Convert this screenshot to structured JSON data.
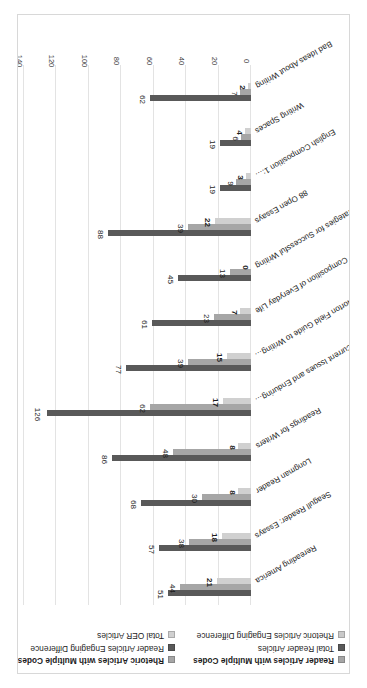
{
  "chart_data": {
    "type": "bar",
    "orientation": "horizontal",
    "title": "",
    "xlabel": "",
    "ylabel": "",
    "xlim": [
      0,
      140
    ],
    "xticks": [
      "0",
      "20",
      "40",
      "60",
      "80",
      "100",
      "120",
      "140"
    ],
    "grid": true,
    "legend_position": "top",
    "rotation_note": "chart rendered rotated 180 degrees on page",
    "categories": [
      "Rereading America",
      "Seagull Reader: Essays",
      "Longman Reader",
      "Readings for Writers",
      "Current Issues and Enduring…",
      "Norton Field Guide to Writing…",
      "Composition of Everyday Life",
      "Strategies for Successful Writing",
      "88 Open Essays",
      "English Composition 1:…",
      "Writing Spaces",
      "Bad Ideas About Writing"
    ],
    "groups": [
      {
        "name": "Reader",
        "categories": [
          "Rereading America",
          "Seagull Reader: Essays",
          "Longman Reader",
          "Readings for Writers"
        ],
        "series": [
          {
            "name": "Total Reader Articles",
            "values": [
              51,
              57,
              68,
              86
            ]
          },
          {
            "name": "Reader Articles with Multiple Codes",
            "values": [
              44,
              38,
              30,
              48
            ]
          },
          {
            "name": "Reader Articles Engaging Difference",
            "values": [
              21,
              18,
              8,
              8
            ]
          }
        ]
      },
      {
        "name": "Rhetoric",
        "categories": [
          "Current Issues and Enduring…",
          "Norton Field Guide to Writing…",
          "Composition of Everyday Life",
          "Strategies for Successful Writing",
          "88 Open Essays"
        ],
        "series": [
          {
            "name": "Total Rhetoric Articles",
            "values": [
              126,
              77,
              61,
              45,
              0
            ]
          },
          {
            "name": "Rhetoric Articles with Multiple Codes",
            "values": [
              62,
              39,
              23,
              13,
              0
            ]
          },
          {
            "name": "Rhetoric Articles Engaging Difference",
            "values": [
              17,
              15,
              7,
              0,
              0
            ]
          }
        ]
      },
      {
        "name": "OER",
        "categories": [
          "English Composition 1:…",
          "Writing Spaces",
          "Bad Ideas About Writing"
        ],
        "series": [
          {
            "name": "Total OER Articles",
            "values": [
              88,
              19,
              19,
              62
            ]
          },
          {
            "name": "OER Articles with Multiple Codes",
            "values": [
              39,
              9,
              6,
              7
            ]
          },
          {
            "name": "OER Articles Engaging Difference",
            "values": [
              22,
              3,
              4,
              2
            ]
          }
        ]
      }
    ],
    "bars": [
      {
        "category": "Rereading America",
        "total": 51,
        "multiple_codes": 44,
        "engaging_difference": 21
      },
      {
        "category": "Seagull Reader: Essays",
        "total": 57,
        "multiple_codes": 38,
        "engaging_difference": 18
      },
      {
        "category": "Longman Reader",
        "total": 68,
        "multiple_codes": 30,
        "engaging_difference": 8
      },
      {
        "category": "Readings for Writers",
        "total": 86,
        "multiple_codes": 48,
        "engaging_difference": 8
      },
      {
        "category": "Current Issues and Enduring…",
        "total": 126,
        "multiple_codes": 62,
        "engaging_difference": 17
      },
      {
        "category": "Norton Field Guide to Writing…",
        "total": 77,
        "multiple_codes": 39,
        "engaging_difference": 15
      },
      {
        "category": "Composition of Everyday Life",
        "total": 61,
        "multiple_codes": 23,
        "engaging_difference": 7
      },
      {
        "category": "Strategies for Successful Writing",
        "total": 45,
        "multiple_codes": 13,
        "engaging_difference": 0
      },
      {
        "category": "88 Open Essays",
        "total": 88,
        "multiple_codes": 39,
        "engaging_difference": 22
      },
      {
        "category": "English Composition 1:…",
        "total": 19,
        "multiple_codes": 9,
        "engaging_difference": 3
      },
      {
        "category": "Writing Spaces",
        "total": 19,
        "multiple_codes": 6,
        "engaging_difference": 4
      },
      {
        "category": "Bad Ideas About Writing",
        "total": 62,
        "multiple_codes": 7,
        "engaging_difference": 2
      }
    ],
    "colors": {
      "multiple_codes": "#a6a6a6",
      "total": "#595959",
      "engaging_difference": "#d0d0d0",
      "gridline": "#e3e3e3",
      "axis": "#9a9a9a",
      "text": "#1d1d1d",
      "background": "#ffffff"
    }
  },
  "legend": {
    "column_left": [
      {
        "label": "Reader Articles with Multiple Codes",
        "color": "#a6a6a6",
        "bold": true
      },
      {
        "label": "Total Reader Articles",
        "color": "#595959",
        "bold": false
      },
      {
        "label": "Rhetoric Articles Engaging Difference",
        "color": "#c9c9c9",
        "bold": false
      }
    ],
    "column_mid": [
      {
        "label": "Rhetoric Articles with Multiple Codes",
        "color": "#a6a6a6",
        "bold": true
      },
      {
        "label": "Reader Articles Engaging Difference",
        "color": "#595959",
        "bold": false
      },
      {
        "label": "Total OER Articles",
        "color": "#d0d0d0",
        "bold": false
      }
    ],
    "column_right": [
      {
        "label": "OER Articles with Multiple Codes",
        "color": "#a6a6a6",
        "bold": true
      },
      {
        "label": "Total Rhetoric Articles",
        "color": "#595959",
        "bold": false
      },
      {
        "label": "OER Articles Engaging Difference",
        "color": "#d0d0d0",
        "bold": false
      }
    ]
  }
}
